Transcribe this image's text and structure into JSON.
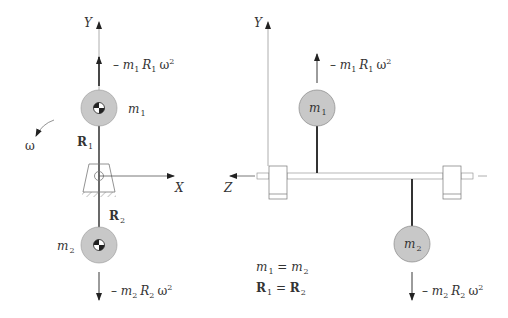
{
  "colors": {
    "mass_fill": "#c8c8c8",
    "mass_stroke": "#8a8a8a",
    "line": "#333333",
    "axis": "#666666",
    "bearing_stroke": "#777777"
  },
  "left_view": {
    "axis_y_label": "Y",
    "axis_x_label": "X",
    "omega_label": "ω",
    "mass1": {
      "label_base": "m",
      "label_sub": "1"
    },
    "mass2": {
      "label_base": "m",
      "label_sub": "2"
    },
    "radius1": {
      "label_base": "R",
      "label_sub": "1"
    },
    "radius2": {
      "label_base": "R",
      "label_sub": "2"
    },
    "force1": {
      "prefix": "– ",
      "m": "m",
      "m_sub": "1",
      "r": "R",
      "r_sub": "1",
      "w": "ω",
      "exp": "2"
    },
    "force2": {
      "prefix": "– ",
      "m": "m",
      "m_sub": "2",
      "r": "R",
      "r_sub": "2",
      "w": "ω",
      "exp": "2"
    }
  },
  "right_view": {
    "axis_y_label": "Y",
    "axis_z_label": "Z",
    "mass1": {
      "label_base": "m",
      "label_sub": "1"
    },
    "mass2": {
      "label_base": "m",
      "label_sub": "2"
    },
    "force1": {
      "prefix": "– ",
      "m": "m",
      "m_sub": "1",
      "r": "R",
      "r_sub": "1",
      "w": "ω",
      "exp": "2"
    },
    "force2": {
      "prefix": "– ",
      "m": "m",
      "m_sub": "2",
      "r": "R",
      "r_sub": "2",
      "w": "ω",
      "exp": "2"
    },
    "equations": [
      {
        "lhs": "m",
        "lhs_sub": "1",
        "eq": " = ",
        "rhs": "m",
        "rhs_sub": "2"
      },
      {
        "lhs": "R",
        "lhs_sub": "1",
        "eq": " = ",
        "rhs": "R",
        "rhs_sub": "2"
      }
    ]
  }
}
